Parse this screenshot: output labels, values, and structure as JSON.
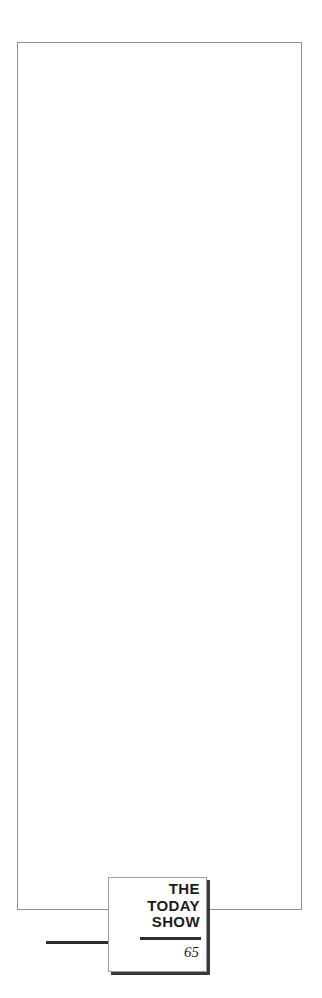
{
  "page": {
    "background_color": "#ffffff",
    "width": 322,
    "height": 998
  },
  "content_frame": {
    "border_color": "#8d8f92",
    "fill_color": "#ffffff",
    "content": ""
  },
  "rules": {
    "baseline_rule_color": "#2e2e30",
    "title_divider_color": "#2e2e30"
  },
  "title_block": {
    "border_color": "#9a9c9f",
    "shadow_color": "#3a3a3c",
    "text_color": "#1b1b1d",
    "lines": [
      "THE",
      "TODAY",
      "SHOW"
    ],
    "page_number": "65"
  }
}
